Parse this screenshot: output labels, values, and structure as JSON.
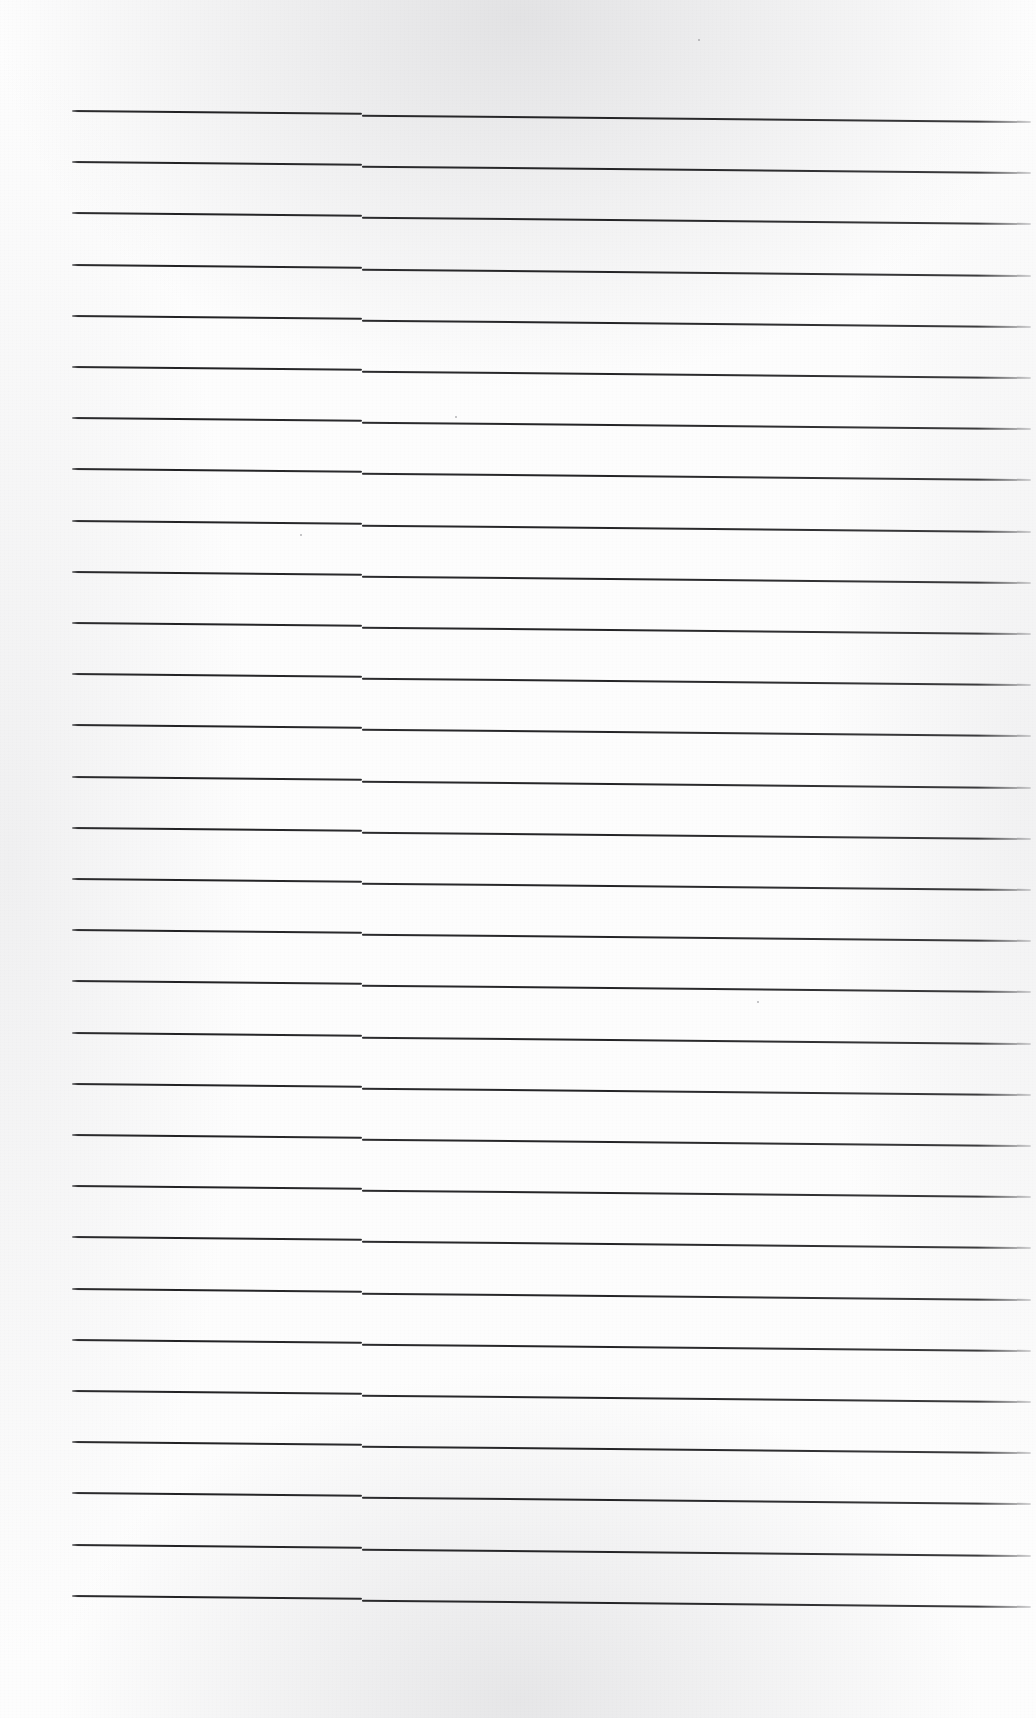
{
  "document": {
    "kind": "scanned-lined-paper",
    "title": "Blank ruled notebook page (scan)",
    "page_width": 1036,
    "page_height": 1718,
    "background_color": "#fdfdfd",
    "has_text_content": false,
    "visible_text": "",
    "notes": "No handwriting, print, headings, page numbers or other text is present on the page."
  },
  "ruling": {
    "line_color": "#2a2a2c",
    "line_thickness_px": 2,
    "line_count": 30,
    "first_line_y": 110,
    "line_spacing_px": 51.2,
    "left_margin_x": 72,
    "right_margin_x": 1031,
    "seam_x": 362,
    "seam_offset_px": 2,
    "slope_px_over_page": 9,
    "description": "Horizontal ruled lines only; each line is split at a scanner seam where the right half sits slightly lower than the left half."
  },
  "margins": {
    "top_blank_px": 110,
    "bottom_blank_px": 93,
    "left_blank_px": 72,
    "right_blank_px": 5
  },
  "artifacts": {
    "specks": [
      {
        "x": 455,
        "y": 416,
        "size": 2
      },
      {
        "x": 300,
        "y": 534,
        "size": 2
      },
      {
        "x": 698,
        "y": 39,
        "size": 2
      },
      {
        "x": 757,
        "y": 1001,
        "size": 2
      }
    ],
    "edge_shading": "faint grey scanner shading along the top, bottom and side edges"
  }
}
